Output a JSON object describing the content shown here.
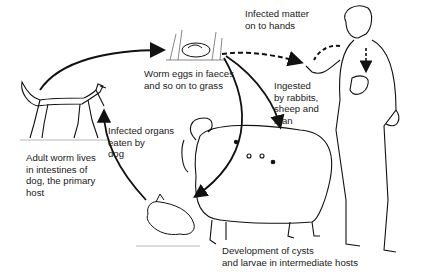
{
  "diagram": {
    "stages": [
      {
        "id": "dog",
        "label": "Adult worm lives\nin intestines of\ndog, the primary\nhost"
      },
      {
        "id": "eggs",
        "label": "Worm eggs in faeces\nand so on to grass"
      },
      {
        "id": "hands",
        "label": "Infected matter\non to hands"
      },
      {
        "id": "ingested",
        "label": "Ingested\nby rabbits,\nsheep and\nman"
      },
      {
        "id": "organs",
        "label": "Infected organs\neaten by\ndog"
      },
      {
        "id": "cysts",
        "label": "Development of cysts\nand larvae in intermediate hosts"
      }
    ],
    "figures": [
      "dog",
      "worm-eggs-in-grass",
      "man",
      "sheep",
      "rabbit"
    ],
    "arrows": [
      {
        "from": "dog",
        "to": "eggs",
        "style": "solid"
      },
      {
        "from": "eggs",
        "to": "hands",
        "style": "dashed"
      },
      {
        "from": "eggs",
        "to": "sheep",
        "style": "solid"
      },
      {
        "from": "eggs",
        "to": "rabbit",
        "style": "solid"
      },
      {
        "from": "rabbit",
        "to": "dog",
        "style": "solid"
      },
      {
        "from": "mouth",
        "to": "liver",
        "style": "dashed"
      }
    ]
  }
}
